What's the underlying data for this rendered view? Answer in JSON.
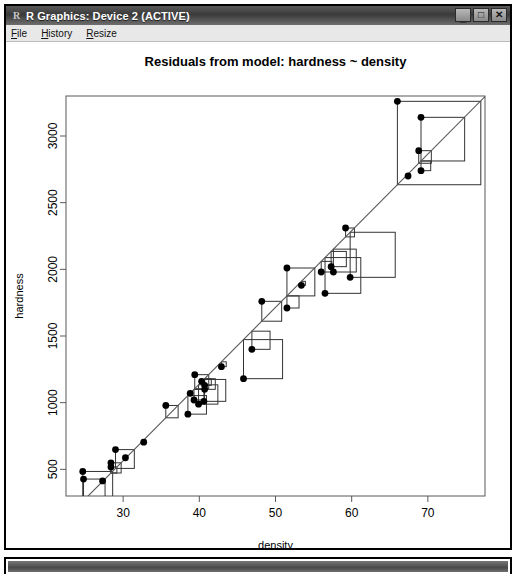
{
  "window": {
    "title": "R Graphics: Device 2 (ACTIVE)",
    "app_icon": "R",
    "controls": [
      {
        "name": "minimize",
        "glyph": "_"
      },
      {
        "name": "maximize",
        "glyph": "□"
      },
      {
        "name": "close",
        "glyph": "✕"
      }
    ]
  },
  "menubar": {
    "items": [
      {
        "accel": "F",
        "rest": "ile"
      },
      {
        "accel": "H",
        "rest": "istory"
      },
      {
        "accel": "R",
        "rest": "esize"
      }
    ]
  },
  "second_window": {
    "title": ""
  },
  "colors": {
    "plot_foreground": "#000000",
    "axis": "#595959",
    "point": "#000000",
    "fit_line": "#555555",
    "residual_square": "#333333",
    "background": "#ffffff"
  },
  "chart_data": {
    "type": "scatter",
    "title": "Residuals from model:  hardness ~ density",
    "xlabel": "density",
    "ylabel": "hardness",
    "xlim": [
      22.5,
      77.5
    ],
    "ylim": [
      300,
      3300
    ],
    "xticks": [
      30,
      40,
      50,
      60,
      70
    ],
    "yticks": [
      500,
      1000,
      1500,
      2000,
      2500,
      3000
    ],
    "grid": false,
    "legend": null,
    "annotations": [
      "Squares drawn at each point show the squared residual from the fitted line."
    ],
    "fit_line": {
      "type": "linear",
      "intercept": -1160.5,
      "slope": 57.5,
      "x_from": 22.5,
      "x_to": 77.5
    },
    "overlay": "residual-squares",
    "points": [
      {
        "x": 24.7,
        "y": 484
      },
      {
        "x": 24.8,
        "y": 427
      },
      {
        "x": 27.3,
        "y": 413
      },
      {
        "x": 28.4,
        "y": 517
      },
      {
        "x": 28.4,
        "y": 549
      },
      {
        "x": 29.0,
        "y": 648
      },
      {
        "x": 30.3,
        "y": 587
      },
      {
        "x": 32.7,
        "y": 704
      },
      {
        "x": 35.6,
        "y": 979
      },
      {
        "x": 38.5,
        "y": 914
      },
      {
        "x": 38.8,
        "y": 1070
      },
      {
        "x": 39.3,
        "y": 1020
      },
      {
        "x": 39.4,
        "y": 1210
      },
      {
        "x": 39.9,
        "y": 989
      },
      {
        "x": 40.3,
        "y": 1160
      },
      {
        "x": 40.6,
        "y": 1010
      },
      {
        "x": 40.7,
        "y": 1100
      },
      {
        "x": 40.7,
        "y": 1130
      },
      {
        "x": 42.9,
        "y": 1270
      },
      {
        "x": 45.8,
        "y": 1180
      },
      {
        "x": 46.9,
        "y": 1400
      },
      {
        "x": 48.2,
        "y": 1760
      },
      {
        "x": 51.5,
        "y": 1710
      },
      {
        "x": 51.5,
        "y": 2010
      },
      {
        "x": 53.4,
        "y": 1880
      },
      {
        "x": 56.0,
        "y": 1980
      },
      {
        "x": 56.5,
        "y": 1820
      },
      {
        "x": 57.3,
        "y": 2020
      },
      {
        "x": 57.6,
        "y": 1980
      },
      {
        "x": 59.2,
        "y": 2310
      },
      {
        "x": 59.8,
        "y": 1940
      },
      {
        "x": 66.0,
        "y": 3260
      },
      {
        "x": 67.4,
        "y": 2700
      },
      {
        "x": 68.8,
        "y": 2890
      },
      {
        "x": 69.1,
        "y": 2740
      },
      {
        "x": 69.1,
        "y": 3140
      }
    ]
  }
}
